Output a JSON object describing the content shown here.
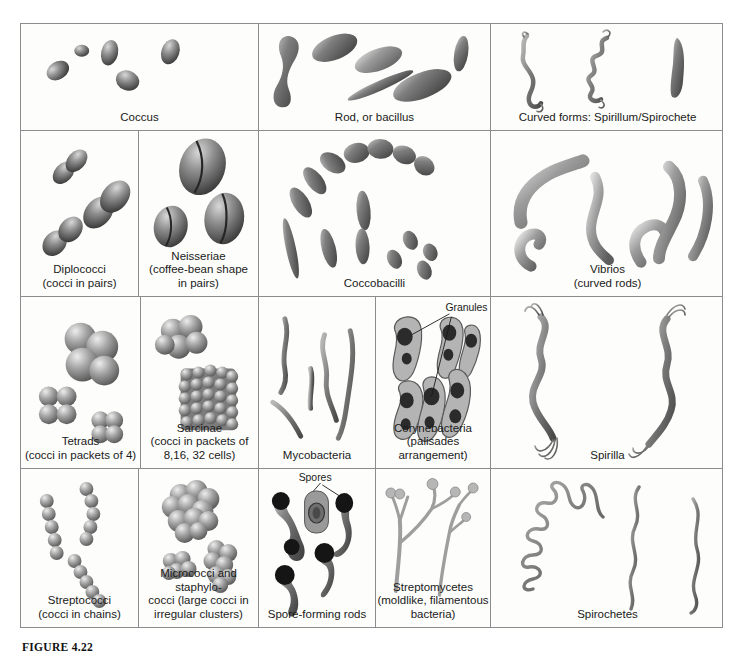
{
  "figure": {
    "caption": "FIGURE 4.22",
    "background_color": "#fdfdfb",
    "border_color": "#8c8c8c",
    "label_color": "#1a1a1a"
  },
  "rows": [
    {
      "id": "row-1",
      "cells": [
        {
          "id": "coccus",
          "label": "Coccus",
          "art": "coccus",
          "annotation": null
        },
        {
          "id": "rod-bacillus",
          "label": "Rod, or bacillus",
          "art": "rod",
          "annotation": null
        },
        {
          "id": "curved-forms",
          "label": "Curved forms: Spirillum/Spirochete",
          "art": "curved",
          "annotation": null
        }
      ]
    },
    {
      "id": "row-2",
      "cells": [
        {
          "id": "diplococci",
          "label": "Diplococci\n(cocci in pairs)",
          "art": "diplococci",
          "annotation": null
        },
        {
          "id": "neisseriae",
          "label": "Neisseriae\n(coffee-bean shape\nin pairs)",
          "art": "neisseriae",
          "annotation": null
        },
        {
          "id": "coccobacilli",
          "label": "Coccobacilli",
          "art": "coccobacilli",
          "annotation": null
        },
        {
          "id": "vibrios",
          "label": "Vibrios\n(curved rods)",
          "art": "vibrios",
          "annotation": null
        }
      ]
    },
    {
      "id": "row-3",
      "cells": [
        {
          "id": "tetrads",
          "label": "Tetrads\n(cocci in packets of 4)",
          "art": "tetrads",
          "annotation": null
        },
        {
          "id": "sarcinae",
          "label": "Sarcinae\n(cocci in packets of\n8,16, 32 cells)",
          "art": "sarcinae",
          "annotation": null
        },
        {
          "id": "mycobacteria",
          "label": "Mycobacteria",
          "art": "mycobacteria",
          "annotation": null
        },
        {
          "id": "corynebacteria",
          "label": "Corynebacteria\n(palisades arrangement)",
          "art": "corynebacteria",
          "annotation": "Granules"
        },
        {
          "id": "spirilla",
          "label": "Spirilla",
          "art": "spirilla",
          "annotation": null
        }
      ]
    },
    {
      "id": "row-4",
      "cells": [
        {
          "id": "streptococci",
          "label": "Streptococci\n(cocci in chains)",
          "art": "streptococci",
          "annotation": null
        },
        {
          "id": "micrococci-staphylococci",
          "label": "Micrococci and staphylo-\ncocci (large cocci in\nirregular clusters)",
          "art": "micrococci",
          "annotation": null
        },
        {
          "id": "spore-forming-rods",
          "label": "Spore-forming rods",
          "art": "spores",
          "annotation": "Spores"
        },
        {
          "id": "streptomycetes",
          "label": "Streptomycetes\n(moldlike, filamentous\nbacteria)",
          "art": "streptomycetes",
          "annotation": null
        },
        {
          "id": "spirochetes",
          "label": "Spirochetes",
          "art": "spirochetes",
          "annotation": null
        }
      ]
    }
  ]
}
